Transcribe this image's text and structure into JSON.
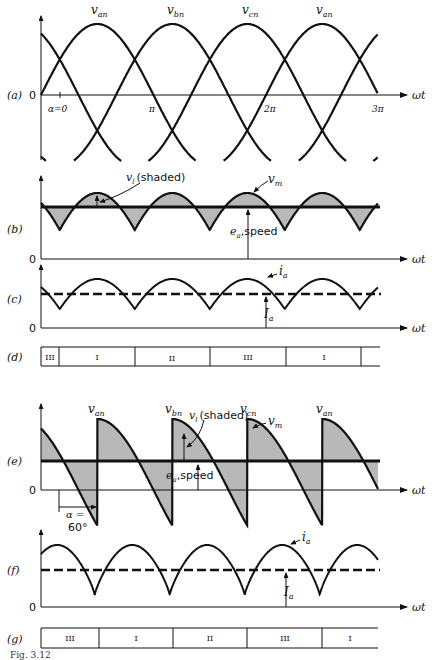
{
  "figure": {
    "caption_partial": "Fig. 3.12",
    "axis_label": "ωt",
    "origin_label": "0",
    "panels": {
      "a": {
        "label": "(a)",
        "curves": [
          "v_an",
          "v_bn",
          "v_cn",
          "v_an"
        ],
        "curve_labels": [
          {
            "main": "v",
            "sub": "an"
          },
          {
            "main": "v",
            "sub": "bn"
          },
          {
            "main": "v",
            "sub": "cn"
          },
          {
            "main": "v",
            "sub": "an"
          }
        ],
        "tick_labels": [
          "α=0",
          "π",
          "2π",
          "3π"
        ]
      },
      "b": {
        "label": "(b)",
        "vl_label_main": "v",
        "vl_label_sub": "l",
        "vl_label_note": "(shaded)",
        "vm_label_main": "v",
        "vm_label_sub": "m",
        "ea_label_main": "e",
        "ea_label_sub": "a",
        "ea_label_note": ",speed"
      },
      "c": {
        "label": "(c)",
        "ia_label_main": "i",
        "ia_label_sub": "a",
        "Ia_label_main": "I",
        "Ia_label_sub": "a"
      },
      "d": {
        "label": "(d)",
        "segments": [
          "III",
          "I",
          "II",
          "III",
          "I",
          ""
        ]
      },
      "e": {
        "label": "(e)",
        "curve_labels": [
          {
            "main": "v",
            "sub": "an"
          },
          {
            "main": "v",
            "sub": "bn"
          },
          {
            "main": "v",
            "sub": "cn"
          },
          {
            "main": "v",
            "sub": "an"
          }
        ],
        "vl_label_main": "v",
        "vl_label_sub": "l",
        "vl_label_note": "(shaded)",
        "vm_label_main": "v",
        "vm_label_sub": "m",
        "ea_label_main": "e",
        "ea_label_sub": "a",
        "ea_label_note": ",speed",
        "alpha_label_line1": "α =",
        "alpha_label_line2": "60°"
      },
      "f": {
        "label": "(f)",
        "ia_label_main": "i",
        "ia_label_sub": "a",
        "Ia_label_main": "I",
        "Ia_label_sub": "a"
      },
      "g": {
        "label": "(g)",
        "segments": [
          "III",
          "I",
          "II",
          "III",
          "I"
        ]
      }
    }
  },
  "colors": {
    "ink": "#111111",
    "shade": "#b8b8b8",
    "background": "#ffffff"
  }
}
